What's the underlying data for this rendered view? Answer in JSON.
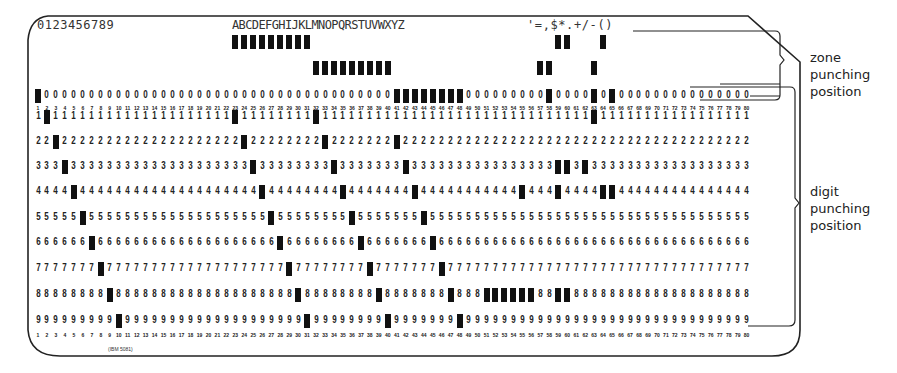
{
  "card": {
    "printed_digits": "0123456789",
    "printed_letters": "ABCDEFGHIJKLMNOPQRSTUVWXYZ",
    "printed_specials": "'=,$*.+/-()",
    "columns": 80,
    "digit_rows": [
      "0",
      "1",
      "2",
      "3",
      "4",
      "5",
      "6",
      "7",
      "8",
      "9"
    ],
    "zone_rows": [
      "12",
      "11"
    ],
    "form_number": "(IBM 5081)",
    "punches": {
      "12": [
        23,
        24,
        25,
        26,
        27,
        28,
        29,
        30,
        31,
        59,
        60,
        64
      ],
      "11": [
        32,
        33,
        34,
        35,
        36,
        37,
        38,
        39,
        40,
        57,
        58,
        63
      ],
      "0": [
        1,
        41,
        42,
        43,
        44,
        45,
        46,
        47,
        48,
        58,
        63,
        65
      ],
      "1": [
        2,
        23,
        32,
        63
      ],
      "2": [
        3,
        24,
        33,
        41
      ],
      "3": [
        4,
        25,
        34,
        42,
        59,
        60,
        62
      ],
      "4": [
        5,
        26,
        35,
        43,
        55,
        59,
        64,
        65
      ],
      "5": [
        6,
        27,
        36,
        44
      ],
      "6": [
        7,
        28,
        37,
        45
      ],
      "7": [
        8,
        29,
        38,
        46
      ],
      "8": [
        9,
        30,
        39,
        47,
        51,
        52,
        53,
        54,
        55,
        56,
        59,
        60
      ],
      "9": [
        10,
        31,
        40,
        48
      ]
    }
  },
  "annotations": {
    "zone_label": [
      "zone",
      "punching",
      "position"
    ],
    "digit_label": [
      "digit",
      "punching",
      "position"
    ]
  }
}
